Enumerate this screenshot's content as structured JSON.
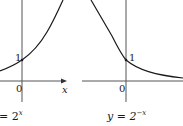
{
  "figures": [
    {
      "id": "left",
      "caption_prefix": "= 2",
      "caption_exponent": "x",
      "function": "y = 2^x",
      "origin_label": "0",
      "point_label": "1",
      "x_axis_label": "x"
    },
    {
      "id": "right",
      "caption_prefix": "y = 2",
      "caption_exponent": "−x",
      "function": "y = 2^-x",
      "origin_label": "0",
      "point_label": "1"
    }
  ],
  "colors": {
    "axis": "#555555",
    "curve": "#1a1a1a",
    "text": "#1a1a1a"
  }
}
